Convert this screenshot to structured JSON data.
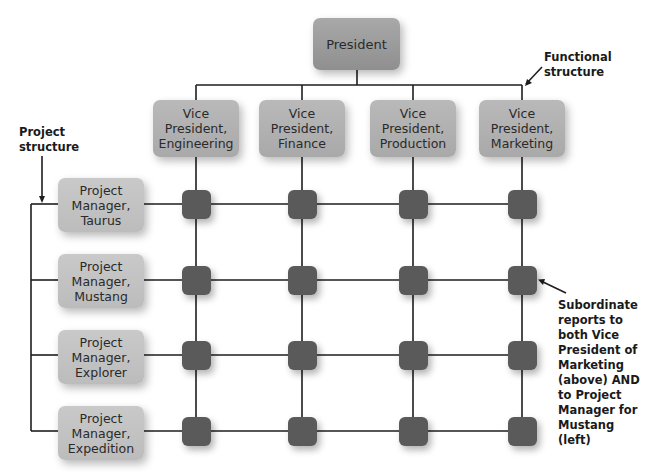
{
  "diagram": {
    "type": "matrix-organization-chart",
    "top": {
      "label": "President"
    },
    "functional_heads": [
      {
        "label": "Vice\nPresident,\nEngineering"
      },
      {
        "label": "Vice\nPresident,\nFinance"
      },
      {
        "label": "Vice\nPresident,\nProduction"
      },
      {
        "label": "Vice\nPresident,\nMarketing"
      }
    ],
    "project_managers": [
      {
        "label": "Project\nManager,\nTaurus"
      },
      {
        "label": "Project\nManager,\nMustang"
      },
      {
        "label": "Project\nManager,\nExplorer"
      },
      {
        "label": "Project\nManager,\nExpedition"
      }
    ],
    "annotations": {
      "functional_structure": "Functional\nstructure",
      "project_structure": "Project\nstructure",
      "subordinate_note": "Subordinate\nreports to\nboth Vice\nPresident of\nMarketing\n(above) AND\nto Project\nManager for\nMustang (left)"
    },
    "grid": {
      "rows": 4,
      "columns": 4
    },
    "colors": {
      "president_box": "#999999",
      "vp_box": "#b1b1b1",
      "pm_box": "#c3c3c3",
      "node": "#5a5a5a",
      "line": "#1e1e1e"
    }
  }
}
